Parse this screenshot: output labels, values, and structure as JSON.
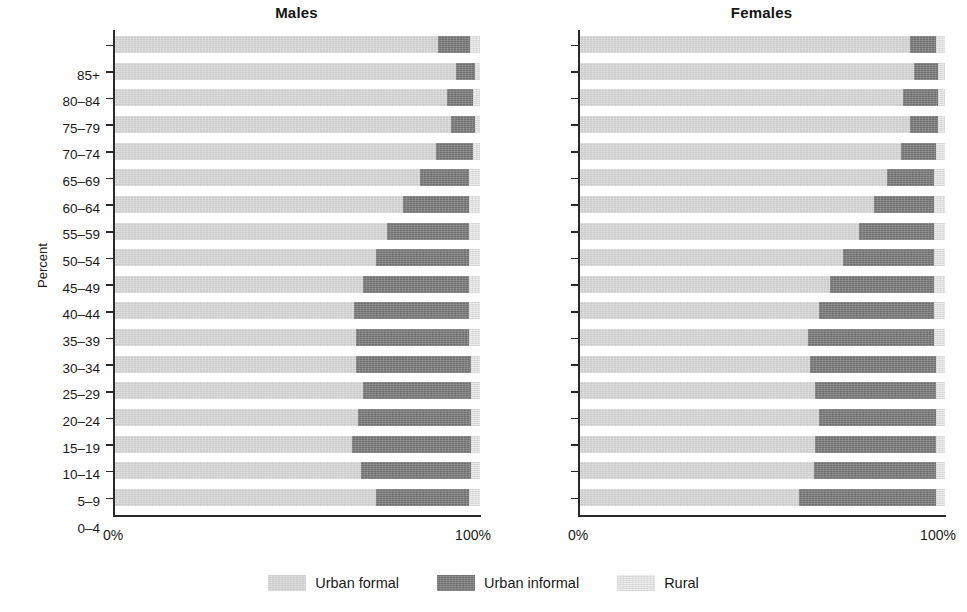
{
  "colors": {
    "urban_formal": "#c9c9c9",
    "urban_informal": "#6f6f6f",
    "rural": "#f0f0f0",
    "axis": "#2a2a2a",
    "text": "#1a1a1a"
  },
  "axis": {
    "y_title": "Percent",
    "x_ticks": [
      "0%",
      "100%"
    ]
  },
  "legend": {
    "items": [
      {
        "label": "Urban formal",
        "key": "urban_formal"
      },
      {
        "label": "Urban informal",
        "key": "urban_informal"
      },
      {
        "label": "Rural",
        "key": "rural"
      }
    ]
  },
  "panels": [
    {
      "id": "males",
      "title": "Males"
    },
    {
      "id": "females",
      "title": "Females"
    }
  ],
  "chart_data": {
    "type": "bar",
    "title": "",
    "subtitle": "",
    "orientation": "horizontal",
    "stacked": true,
    "stack_total": 100,
    "xlabel": "",
    "ylabel": "Percent",
    "xlim": [
      0,
      100
    ],
    "grid": false,
    "legend_position": "bottom",
    "legend_entries": [
      "Urban formal",
      "Urban informal",
      "Rural"
    ],
    "categories": [
      "85+",
      "80–84",
      "75–79",
      "70–74",
      "65–69",
      "60–64",
      "55–59",
      "50–54",
      "45–49",
      "40–44",
      "35–39",
      "30–34",
      "25–29",
      "20–24",
      "15–19",
      "10–14",
      "5–9",
      "0–4"
    ],
    "panels": [
      {
        "name": "Males",
        "series": [
          {
            "name": "Urban formal",
            "values": [
              88.5,
              93.5,
              91.0,
              92.0,
              88.0,
              83.5,
              79.0,
              74.5,
              71.5,
              68.0,
              65.5,
              66.0,
              66.0,
              68.0,
              66.5,
              65.0,
              67.5,
              71.5
            ]
          },
          {
            "name": "Urban informal",
            "values": [
              8.8,
              5.2,
              7.2,
              6.6,
              10.0,
              13.5,
              18.0,
              22.5,
              25.5,
              29.0,
              31.5,
              31.0,
              31.5,
              29.5,
              31.0,
              32.5,
              30.0,
              25.5
            ]
          },
          {
            "name": "Rural",
            "values": [
              2.7,
              1.3,
              1.8,
              1.4,
              2.0,
              3.0,
              3.0,
              3.0,
              3.0,
              3.0,
              3.0,
              3.0,
              2.5,
              2.5,
              2.5,
              2.5,
              2.5,
              3.0
            ]
          }
        ]
      },
      {
        "name": "Females",
        "series": [
          {
            "name": "Urban formal",
            "values": [
              90.5,
              91.5,
              88.5,
              90.5,
              88.0,
              84.0,
              80.5,
              76.5,
              72.0,
              68.5,
              65.5,
              62.5,
              63.0,
              64.5,
              65.5,
              64.5,
              64.0,
              60.0
            ]
          },
          {
            "name": "Urban informal",
            "values": [
              7.0,
              6.5,
              9.5,
              7.5,
              9.5,
              13.0,
              16.5,
              20.5,
              25.0,
              28.5,
              31.5,
              34.5,
              34.5,
              33.0,
              32.0,
              33.0,
              33.5,
              37.5
            ]
          },
          {
            "name": "Rural",
            "values": [
              2.5,
              2.0,
              2.0,
              2.0,
              2.5,
              3.0,
              3.0,
              3.0,
              3.0,
              3.0,
              3.0,
              3.0,
              2.5,
              2.5,
              2.5,
              2.5,
              2.5,
              2.5
            ]
          }
        ]
      }
    ]
  }
}
